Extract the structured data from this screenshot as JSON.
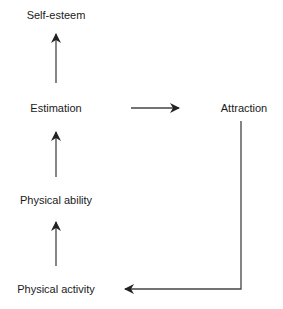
{
  "diagram": {
    "type": "flow",
    "nodes": [
      {
        "id": "self_esteem",
        "label": "Self-esteem"
      },
      {
        "id": "estimation",
        "label": "Estimation"
      },
      {
        "id": "attraction",
        "label": "Attraction"
      },
      {
        "id": "physical_ability",
        "label": "Physical ability"
      },
      {
        "id": "physical_activity",
        "label": "Physical activity"
      }
    ],
    "edges": [
      {
        "from": "physical_activity",
        "to": "physical_ability"
      },
      {
        "from": "physical_ability",
        "to": "estimation"
      },
      {
        "from": "estimation",
        "to": "self_esteem"
      },
      {
        "from": "estimation",
        "to": "attraction"
      },
      {
        "from": "attraction",
        "to": "physical_activity"
      }
    ],
    "colors": {
      "background": "#ffffff",
      "text": "#1a1a1a",
      "arrow": "#222222"
    }
  }
}
